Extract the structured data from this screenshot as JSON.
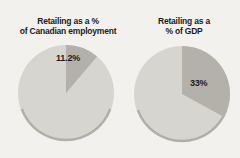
{
  "palette": {
    "background": "#f2f1ed",
    "pie_light": "#d7d5cf",
    "pie_dark": "#b3b1a9",
    "pie_rim": "#a5a29a",
    "text": "#1c1c1c"
  },
  "chart_data": [
    {
      "type": "pie",
      "title": "Retailing as a % of Canadian employment",
      "title_lines": [
        "Retailing as a %",
        "of Canadian employment"
      ],
      "start_angle_deg": 0,
      "direction": "clockwise",
      "slices": [
        {
          "label": "Retailing",
          "value": 11.2,
          "display": "11.2%",
          "color_key": "pie_dark"
        },
        {
          "label": "Rest of employment",
          "value": 88.8,
          "display": "",
          "color_key": "pie_light"
        }
      ]
    },
    {
      "type": "pie",
      "title": "Retailing as a % of GDP",
      "title_lines": [
        "Retailing as a",
        "% of GDP"
      ],
      "start_angle_deg": 0,
      "direction": "clockwise",
      "slices": [
        {
          "label": "Retailing",
          "value": 33,
          "display": "33%",
          "color_key": "pie_dark"
        },
        {
          "label": "Rest of GDP",
          "value": 67,
          "display": "",
          "color_key": "pie_light"
        }
      ]
    }
  ]
}
